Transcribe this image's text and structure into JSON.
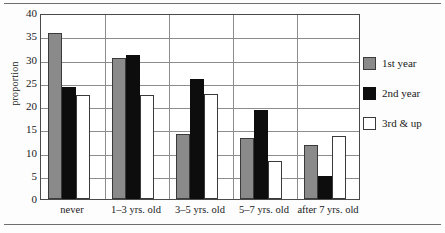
{
  "chart_data": {
    "type": "bar",
    "title": "",
    "subtitle": "",
    "xlabel": "",
    "ylabel": "proportion",
    "ylim": [
      0,
      40
    ],
    "yticks": [
      0,
      5,
      10,
      15,
      20,
      25,
      30,
      35,
      40
    ],
    "ytick_labels": [
      "0",
      "5",
      "10",
      "15",
      "20",
      "25",
      "30",
      "35",
      "40"
    ],
    "grid": true,
    "legend_position": "right",
    "categories": [
      "never",
      "1–3 yrs. old",
      "3–5 yrs. old",
      "5–7 yrs. old",
      "after 7 yrs. old"
    ],
    "series": [
      {
        "name": "1st year",
        "color": "#8a8a8a",
        "values": [
          35.8,
          30.4,
          14.0,
          13.1,
          11.7
        ]
      },
      {
        "name": "2nd year",
        "color": "#0d0d0d",
        "values": [
          24.0,
          30.9,
          25.8,
          19.2,
          5.0
        ]
      },
      {
        "name": "3rd & up",
        "color": "#ffffff",
        "values": [
          22.3,
          22.3,
          22.5,
          8.1,
          13.5
        ]
      }
    ]
  },
  "legend": {
    "entries": [
      {
        "label": "1st year",
        "swatch": "gray-swatch"
      },
      {
        "label": "2nd year",
        "swatch": "black-swatch"
      },
      {
        "label": "3rd & up",
        "swatch": "white-swatch"
      }
    ]
  },
  "colors": {
    "series_1st_year": "#8a8a8a",
    "series_2nd_year": "#0d0d0d",
    "series_3rd_and_up": "#ffffff",
    "axis": "#4a4a4a",
    "grid": "#8d8d8d",
    "text": "#1a1a1a",
    "background": "#ffffff"
  }
}
